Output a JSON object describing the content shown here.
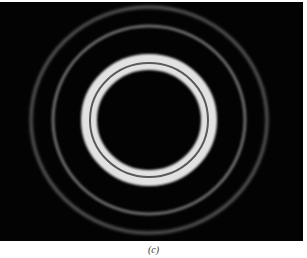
{
  "figure": {
    "panel_label": "(c)",
    "image": {
      "subject": "concentric diffraction rings on black background",
      "background_color": "#030303",
      "center": [
        149,
        118
      ],
      "rings": [
        {
          "name": "inner-bright-ring",
          "rx": 60,
          "ry": 58,
          "width": 16,
          "color": "#e2e2e2",
          "blur": 1.2
        },
        {
          "name": "inner-dark-gap",
          "rx": 59,
          "ry": 57,
          "width": 2,
          "color": "#5a5a5a",
          "blur": 0.5
        },
        {
          "name": "middle-faint-ring",
          "rx": 96,
          "ry": 94,
          "width": 3,
          "color": "#6a6a6a",
          "blur": 1.2
        },
        {
          "name": "outer-faint-ring",
          "rx": 118,
          "ry": 113,
          "width": 3,
          "color": "#5c5c5c",
          "blur": 1.4
        }
      ]
    }
  }
}
